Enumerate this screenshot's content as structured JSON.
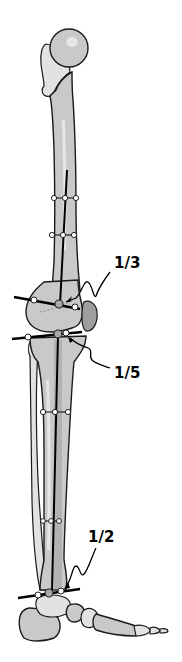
{
  "diagram": {
    "labels": [
      {
        "id": "knee-upper",
        "text": "1/3"
      },
      {
        "id": "knee-lower",
        "text": "1/5"
      },
      {
        "id": "ankle",
        "text": "1/2"
      }
    ],
    "colors": {
      "bone": "#c9c9c9",
      "outline": "#1a1a1a",
      "marker_fill": "#ffffff",
      "center_marker_fill": "#a8a8a8",
      "lines": "#000000"
    }
  }
}
